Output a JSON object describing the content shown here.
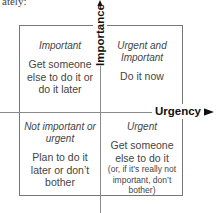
{
  "header": {
    "cut_text": "ately:"
  },
  "axes": {
    "vertical": {
      "label": "Importance",
      "direction": "up"
    },
    "horizontal": {
      "label": "Urgency",
      "direction": "right"
    }
  },
  "quadrants": {
    "top_left": {
      "title": "Important",
      "action": "Get someone else to do it or do it later"
    },
    "top_right": {
      "title": "Urgent and Important",
      "action": "Do it now"
    },
    "bottom_left": {
      "title": "Not important or urgent",
      "action": "Plan to do it later or don’t bother"
    },
    "bottom_right": {
      "title": "Urgent",
      "action": "Get someone else to do it",
      "note": "(or, if it’s really not important, don’t bother)"
    }
  },
  "colors": {
    "axis": "#8a8a8a",
    "box_border": "#777777",
    "arrow": "#111111",
    "text": "#444444"
  }
}
